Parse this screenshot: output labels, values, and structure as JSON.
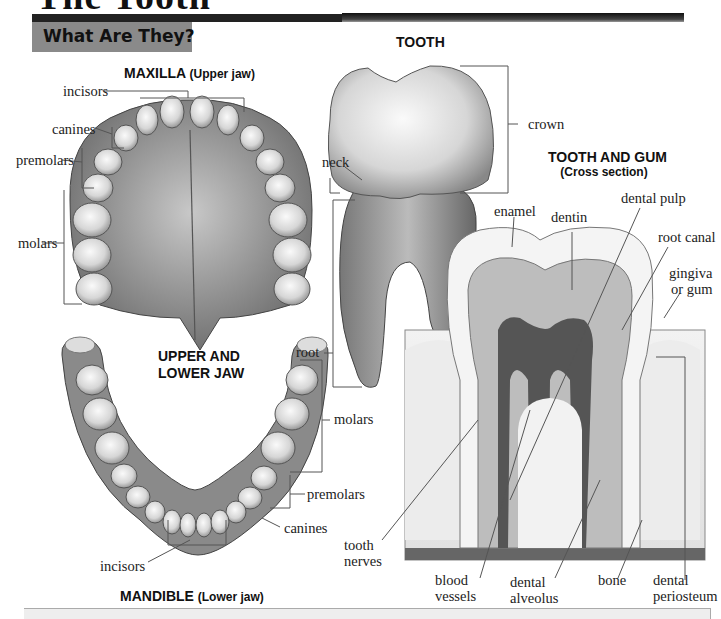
{
  "page": {
    "title": "The Tooth",
    "section_heading": "What Are They?"
  },
  "maxilla": {
    "heading": "MAXILLA",
    "heading_sub": "(Upper jaw)",
    "labels": {
      "incisors": "incisors",
      "canines": "canines",
      "premolars": "premolars",
      "molars": "molars"
    }
  },
  "jaw_center": {
    "line1": "UPPER AND",
    "line2": "LOWER JAW"
  },
  "mandible": {
    "heading": "MANDIBLE",
    "heading_sub": "(Lower jaw)",
    "labels": {
      "molars": "molars",
      "premolars": "premolars",
      "canines": "canines",
      "incisors": "incisors"
    }
  },
  "tooth": {
    "heading": "TOOTH",
    "labels": {
      "crown": "crown",
      "neck": "neck",
      "root": "root"
    }
  },
  "cross_section": {
    "heading": "TOOTH AND GUM",
    "heading_sub": "(Cross section)",
    "labels": {
      "enamel": "enamel",
      "dentin": "dentin",
      "dental_pulp": "dental pulp",
      "root_canal": "root canal",
      "gingiva_1": "gingiva",
      "gingiva_2": "or gum",
      "tooth_nerves_1": "tooth",
      "tooth_nerves_2": "nerves",
      "blood_vessels_1": "blood",
      "blood_vessels_2": "vessels",
      "dental_alveolus_1": "dental",
      "dental_alveolus_2": "alveolus",
      "bone": "bone",
      "dental_periosteum_1": "dental",
      "dental_periosteum_2": "periosteum"
    }
  }
}
